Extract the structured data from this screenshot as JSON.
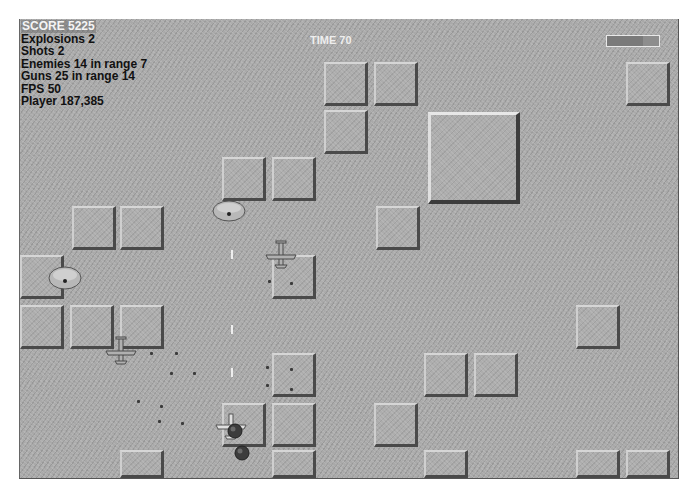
{
  "hud": {
    "score_label": "SCORE 5225",
    "explosions_label": "Explosions 2",
    "shots_label": "Shots 2",
    "enemies_label": "Enemies 14 in range 7",
    "guns_label": "Guns 25 in range 14",
    "fps_label": "FPS 50",
    "player_label": "Player 187,385"
  },
  "timer": {
    "label": "TIME 70"
  },
  "health_bar": {
    "percent": 70,
    "border_color": "#e8e8e8"
  },
  "colors": {
    "ground": "#a9a9a9",
    "block_highlight": "#d6d6d6",
    "block_shadow": "#4a4a4a",
    "hud_text": "#111111",
    "score_text": "#f4f4f4"
  },
  "blocks": [
    {
      "x": 324,
      "y": 62
    },
    {
      "x": 374,
      "y": 62
    },
    {
      "x": 626,
      "y": 62
    },
    {
      "x": 324,
      "y": 110
    },
    {
      "x": 428,
      "y": 112,
      "big": true
    },
    {
      "x": 222,
      "y": 157
    },
    {
      "x": 272,
      "y": 157
    },
    {
      "x": 72,
      "y": 206
    },
    {
      "x": 120,
      "y": 206
    },
    {
      "x": 376,
      "y": 206
    },
    {
      "x": 20,
      "y": 255
    },
    {
      "x": 272,
      "y": 255
    },
    {
      "x": 20,
      "y": 305
    },
    {
      "x": 70,
      "y": 305
    },
    {
      "x": 120,
      "y": 305
    },
    {
      "x": 576,
      "y": 305
    },
    {
      "x": 272,
      "y": 353
    },
    {
      "x": 424,
      "y": 353
    },
    {
      "x": 474,
      "y": 353
    },
    {
      "x": 222,
      "y": 403
    },
    {
      "x": 272,
      "y": 403
    },
    {
      "x": 374,
      "y": 403
    },
    {
      "x": 120,
      "y": 450
    },
    {
      "x": 272,
      "y": 450
    },
    {
      "x": 424,
      "y": 450
    },
    {
      "x": 576,
      "y": 450
    },
    {
      "x": 626,
      "y": 450
    }
  ],
  "gun_turrets": [
    {
      "x": 212,
      "y": 200,
      "w": 34,
      "h": 22
    },
    {
      "x": 48,
      "y": 266,
      "w": 34,
      "h": 24
    }
  ],
  "enemy_planes": [
    {
      "x": 264,
      "y": 240
    },
    {
      "x": 104,
      "y": 336
    }
  ],
  "player": {
    "x": 214,
    "y": 412
  },
  "bombs": [
    {
      "x": 227,
      "y": 423
    },
    {
      "x": 234,
      "y": 445
    }
  ],
  "bullets": [
    {
      "x": 231,
      "y": 250
    },
    {
      "x": 231,
      "y": 325
    },
    {
      "x": 231,
      "y": 368
    }
  ],
  "debris": [
    {
      "x": 150,
      "y": 352
    },
    {
      "x": 175,
      "y": 352
    },
    {
      "x": 170,
      "y": 372
    },
    {
      "x": 193,
      "y": 372
    },
    {
      "x": 137,
      "y": 400
    },
    {
      "x": 160,
      "y": 405
    },
    {
      "x": 158,
      "y": 420
    },
    {
      "x": 181,
      "y": 422
    },
    {
      "x": 266,
      "y": 366
    },
    {
      "x": 290,
      "y": 368
    },
    {
      "x": 266,
      "y": 384
    },
    {
      "x": 290,
      "y": 388
    },
    {
      "x": 268,
      "y": 280
    },
    {
      "x": 290,
      "y": 282
    }
  ]
}
